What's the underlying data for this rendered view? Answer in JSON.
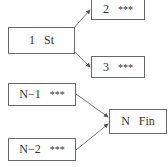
{
  "diagram": {
    "nodes": [
      {
        "id": "n1",
        "number": "1",
        "label": "St"
      },
      {
        "id": "n2",
        "number": "2",
        "label": "***"
      },
      {
        "id": "n3",
        "number": "3",
        "label": "***"
      },
      {
        "id": "nm1",
        "number": "N−1",
        "label": "***"
      },
      {
        "id": "nfin",
        "number": "N",
        "label": "Fin"
      },
      {
        "id": "nm2",
        "number": "N−2",
        "label": "***"
      }
    ],
    "edges": [
      {
        "from": "n1",
        "to": "n2"
      },
      {
        "from": "n1",
        "to": "n3"
      },
      {
        "from": "nm1",
        "to": "nfin"
      },
      {
        "from": "nm2",
        "to": "nfin"
      }
    ],
    "colors": {
      "border": "#6a6a6a",
      "text": "#333333",
      "arrow": "#555555"
    }
  }
}
